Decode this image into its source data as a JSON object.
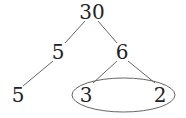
{
  "diagram": {
    "type": "factor-tree",
    "root": "30",
    "nodes": [
      {
        "id": "n30",
        "label": "30",
        "x": 92,
        "y": 12
      },
      {
        "id": "n5a",
        "label": "5",
        "x": 58,
        "y": 52
      },
      {
        "id": "n6",
        "label": "6",
        "x": 122,
        "y": 52
      },
      {
        "id": "n5b",
        "label": "5",
        "x": 18,
        "y": 95
      },
      {
        "id": "n3",
        "label": "3",
        "x": 86,
        "y": 95
      },
      {
        "id": "n2",
        "label": "2",
        "x": 160,
        "y": 95
      }
    ],
    "edges": [
      [
        "n30",
        "n5a"
      ],
      [
        "n30",
        "n6"
      ],
      [
        "n5a",
        "n5b"
      ],
      [
        "n6",
        "n3"
      ],
      [
        "n6",
        "n2"
      ]
    ],
    "highlight": {
      "shape": "ellipse",
      "encloses": [
        "n3",
        "n2"
      ]
    },
    "line_color": "#555555",
    "text_color": "#222222"
  }
}
